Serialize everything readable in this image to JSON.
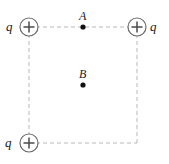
{
  "figure": {
    "type": "physics-diagram",
    "width": 169,
    "height": 164,
    "background_color": "#ffffff"
  },
  "colors": {
    "dashed_line": "#b9b9b9",
    "circle_stroke": "#6b6b6b",
    "plus_stroke": "#4a4a4a",
    "dot_fill": "#111111",
    "text": "#1a1a1a"
  },
  "square": {
    "dash_pattern": "4 3",
    "stroke_width": 1,
    "corners": {
      "top_left": [
        29,
        27
      ],
      "top_right": [
        137,
        27
      ],
      "bottom_right": [
        137,
        143
      ],
      "bottom_left": [
        29,
        143
      ]
    },
    "side_length_px": 108
  },
  "charges": [
    {
      "id": "charge-top-left",
      "label": "q",
      "sign": "+",
      "sign_glyph": "plus-sign",
      "position": [
        29,
        27
      ],
      "radius": 9,
      "label_side": "left"
    },
    {
      "id": "charge-top-right",
      "label": "q",
      "sign": "+",
      "sign_glyph": "plus-sign",
      "position": [
        137,
        27
      ],
      "radius": 9,
      "label_side": "right"
    },
    {
      "id": "charge-bottom-left",
      "label": "q",
      "sign": "+",
      "sign_glyph": "plus-sign",
      "position": [
        29,
        143
      ],
      "radius": 9,
      "label_side": "left"
    }
  ],
  "empty_corner": {
    "id": "corner-bottom-right",
    "position": [
      137,
      143
    ],
    "has_charge": false
  },
  "points": [
    {
      "id": "point-a",
      "label": "A",
      "position": [
        83,
        27
      ],
      "dot_radius": 2.6,
      "label_offset": "above",
      "location_note": "midpoint of top side"
    },
    {
      "id": "point-b",
      "label": "B",
      "position": [
        83,
        85
      ],
      "dot_radius": 2.6,
      "label_offset": "above",
      "location_note": "center of square"
    }
  ]
}
